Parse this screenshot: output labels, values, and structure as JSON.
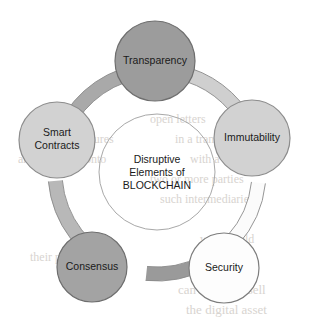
{
  "diagram": {
    "title": "Disruptive Elements of BLOCKCHAIN",
    "type": "circular-hub-and-spoke",
    "center": {
      "line1": "Disruptive",
      "line2": "Elements of",
      "line3": "BLOCKCHAIN",
      "cx": 157,
      "cy": 172,
      "r": 58,
      "fill": "none",
      "stroke": "#a8a8a8"
    },
    "ring": {
      "cx": 157,
      "cy": 172,
      "r": 102,
      "stroke_width": 14,
      "segments": [
        {
          "name": "smart-contracts-to-transparency",
          "from": "smart-contracts",
          "to": "transparency",
          "color": "#b8b8b8",
          "start_deg": 200,
          "end_deg": 265
        },
        {
          "name": "transparency-to-immutability",
          "from": "transparency",
          "to": "immutability",
          "color": "#a9a9a9",
          "start_deg": 288,
          "end_deg": 348
        },
        {
          "name": "immutability-to-security",
          "from": "immutability",
          "to": "security",
          "color": "#cfcfcf",
          "start_deg": 12,
          "end_deg": 62
        },
        {
          "name": "security-to-consensus",
          "from": "security",
          "to": "consensus",
          "color": "#fbfbfb",
          "start_deg": 96,
          "end_deg": 132
        },
        {
          "name": "consensus-to-smart-contracts",
          "from": "consensus",
          "to": "smart-contracts",
          "color": "#9a9a9a",
          "start_deg": 152,
          "end_deg": 186
        }
      ]
    },
    "nodes": [
      {
        "id": "transparency",
        "label": "Transparency",
        "lines": [
          "Transparency"
        ],
        "cx": 155,
        "cy": 61,
        "r": 40,
        "fill": "#9c9c9c",
        "stroke": "#6e6e6e",
        "text_color": "#1a1a1a"
      },
      {
        "id": "immutability",
        "label": "Immutability",
        "lines": [
          "Immutability"
        ],
        "cx": 252,
        "cy": 138,
        "r": 38,
        "fill": "#d2d2d2",
        "stroke": "#8c8c8c",
        "text_color": "#1a1a1a"
      },
      {
        "id": "security",
        "label": "Security",
        "lines": [
          "Security"
        ],
        "cx": 224,
        "cy": 268,
        "r": 35,
        "fill": "#fdfdfd",
        "stroke": "#7d7d7d",
        "text_color": "#1a1a1a"
      },
      {
        "id": "consensus",
        "label": "Consensus",
        "lines": [
          "Consensus"
        ],
        "cx": 92,
        "cy": 267,
        "r": 35,
        "fill": "#a3a3a3",
        "stroke": "#6e6e6e",
        "text_color": "#1a1a1a"
      },
      {
        "id": "smart-contracts",
        "label": "Smart Contracts",
        "lines": [
          "Smart",
          "Contracts"
        ],
        "cx": 57,
        "cy": 140,
        "r": 38,
        "fill": "#d2d2d2",
        "stroke": "#8c8c8c",
        "text_color": "#1a1a1a"
      }
    ],
    "background_ghost_text": [
      {
        "text": "open letters",
        "x": 150,
        "y": 112,
        "size": 12
      },
      {
        "text": "blockchain ensures",
        "x": 22,
        "y": 132,
        "size": 12
      },
      {
        "text": "in a transaction",
        "x": 175,
        "y": 132,
        "size": 12
      },
      {
        "text": "and is logged onto",
        "x": 18,
        "y": 152,
        "size": 12
      },
      {
        "text": "with a timestamp",
        "x": 190,
        "y": 152,
        "size": 12
      },
      {
        "text": "two or more parties",
        "x": 150,
        "y": 172,
        "size": 12
      },
      {
        "text": "such intermediaries",
        "x": 160,
        "y": 192,
        "size": 12
      },
      {
        "text": "would hold",
        "x": 200,
        "y": 232,
        "size": 12
      },
      {
        "text": "their private",
        "x": 30,
        "y": 250,
        "size": 12
      },
      {
        "text": "can hold and sell",
        "x": 178,
        "y": 282,
        "size": 13
      },
      {
        "text": "the digital asset",
        "x": 186,
        "y": 302,
        "size": 13
      }
    ]
  }
}
